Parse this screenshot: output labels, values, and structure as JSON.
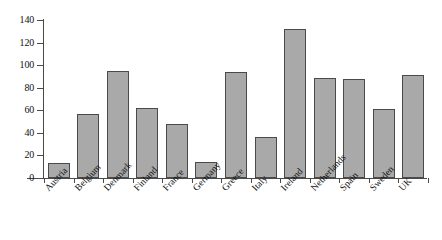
{
  "chart_data": {
    "type": "bar",
    "title": "",
    "subtitle": "",
    "xlabel": "",
    "ylabel": "",
    "categories": [
      "Austria",
      "Belgium",
      "Denmark",
      "Finland",
      "France",
      "Germany",
      "Greece",
      "Italy",
      "Ireland",
      "Netherlands",
      "Spain",
      "Sweden",
      "UK"
    ],
    "values": [
      13,
      57,
      95,
      62,
      48,
      14,
      94,
      36,
      132,
      89,
      88,
      61,
      91
    ],
    "ylim": [
      0,
      140
    ],
    "yticks": [
      0,
      20,
      40,
      60,
      80,
      100,
      120,
      140
    ],
    "ytick_labels": [
      "0",
      "20",
      "40",
      "60",
      "80",
      "100",
      "120",
      "140"
    ],
    "grid": false,
    "legend": null,
    "legend_position": "none",
    "series": [
      {
        "name": "",
        "values": [
          13,
          57,
          95,
          62,
          48,
          14,
          94,
          36,
          132,
          89,
          88,
          61,
          91
        ]
      }
    ],
    "colors": {
      "bar_fill": "#a9a9a9",
      "bar_border": "#4a4a4a",
      "axis": "#4a4a4a",
      "text": "#111111",
      "background": "#ffffff"
    }
  }
}
